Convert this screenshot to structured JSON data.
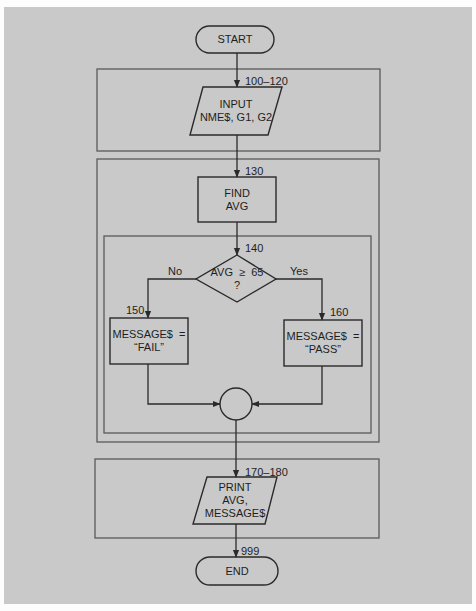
{
  "diagram": {
    "type": "flowchart",
    "colors": {
      "background": "#c9c9c9",
      "page": "#fdfdfd",
      "stroke": "#2a2a2a",
      "module_border": "#5a5a5a",
      "text": "#1e1e1e"
    },
    "nodes": {
      "start": {
        "shape": "terminal",
        "text": "START"
      },
      "input": {
        "shape": "parallelogram",
        "lines": [
          "INPUT",
          "NME$, G1, G2"
        ],
        "line_label": "100–120"
      },
      "find_avg": {
        "shape": "process",
        "lines": [
          "FIND",
          "AVG"
        ],
        "line_label": "130"
      },
      "decision": {
        "shape": "decision",
        "lines": [
          "AVG  ≥  65",
          "?"
        ],
        "line_label": "140",
        "no_label": "No",
        "yes_label": "Yes"
      },
      "fail": {
        "shape": "process",
        "lines": [
          "MESSAGE$  =",
          "“FAIL”"
        ],
        "line_label": "150"
      },
      "pass": {
        "shape": "process",
        "lines": [
          "MESSAGE$  =",
          "“PASS”"
        ],
        "line_label": "160"
      },
      "connector": {
        "shape": "connector"
      },
      "print": {
        "shape": "parallelogram",
        "lines": [
          "PRINT",
          "AVG,",
          "MESSAGE$"
        ],
        "line_label": "170–180"
      },
      "end": {
        "shape": "terminal",
        "text": "END",
        "line_label": "999"
      }
    },
    "edges": [
      {
        "from": "start",
        "to": "input"
      },
      {
        "from": "input",
        "to": "find_avg"
      },
      {
        "from": "find_avg",
        "to": "decision"
      },
      {
        "from": "decision",
        "to": "fail",
        "label": "No"
      },
      {
        "from": "decision",
        "to": "pass",
        "label": "Yes"
      },
      {
        "from": "fail",
        "to": "connector"
      },
      {
        "from": "pass",
        "to": "connector"
      },
      {
        "from": "connector",
        "to": "print"
      },
      {
        "from": "print",
        "to": "end"
      }
    ],
    "modules": [
      {
        "name": "input-module",
        "contains": [
          "input"
        ]
      },
      {
        "name": "process-module",
        "contains": [
          "find_avg",
          "decision",
          "fail",
          "pass",
          "connector"
        ]
      },
      {
        "name": "decision-module",
        "contains": [
          "decision",
          "fail",
          "pass",
          "connector"
        ]
      },
      {
        "name": "output-module",
        "contains": [
          "print"
        ]
      }
    ]
  }
}
